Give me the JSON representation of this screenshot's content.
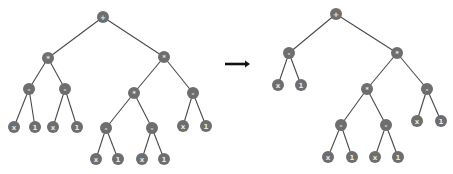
{
  "diagram": {
    "node_color": "#6e6e6e",
    "edge_color": "#4a4a4a",
    "node_radius": 6,
    "arrow": {
      "x1": 225,
      "y1": 64,
      "x2": 250,
      "y2": 64,
      "color": "#111111"
    },
    "trees": [
      {
        "name": "before",
        "nodes": [
          {
            "id": "a0",
            "label": "+",
            "x": 103,
            "y": 17
          },
          {
            "id": "a1",
            "label": "*",
            "x": 48,
            "y": 58
          },
          {
            "id": "a2",
            "label": "*",
            "x": 164,
            "y": 57
          },
          {
            "id": "a3",
            "label": "-",
            "x": 29,
            "y": 89
          },
          {
            "id": "a4",
            "label": "-",
            "x": 65,
            "y": 89
          },
          {
            "id": "a5",
            "label": "*",
            "x": 134,
            "y": 93
          },
          {
            "id": "a6",
            "label": "-",
            "x": 193,
            "y": 93
          },
          {
            "id": "a7",
            "label": "x",
            "x": 14,
            "y": 127
          },
          {
            "id": "a8",
            "label": "1",
            "x": 35,
            "y": 127
          },
          {
            "id": "a9",
            "label": "x",
            "x": 53,
            "y": 127
          },
          {
            "id": "a10",
            "label": "1",
            "x": 77,
            "y": 127
          },
          {
            "id": "a11",
            "label": "-",
            "x": 106,
            "y": 128
          },
          {
            "id": "a12",
            "label": "-",
            "x": 152,
            "y": 128
          },
          {
            "id": "a13",
            "label": "x",
            "x": 183,
            "y": 126
          },
          {
            "id": "a14",
            "label": "1",
            "x": 206,
            "y": 126
          },
          {
            "id": "a15",
            "label": "x",
            "x": 96,
            "y": 159
          },
          {
            "id": "a16",
            "label": "1",
            "x": 118,
            "y": 159
          },
          {
            "id": "a17",
            "label": "x",
            "x": 142,
            "y": 159
          },
          {
            "id": "a18",
            "label": "1",
            "x": 164,
            "y": 159
          }
        ],
        "edges": [
          [
            "a0",
            "a1"
          ],
          [
            "a0",
            "a2"
          ],
          [
            "a1",
            "a3"
          ],
          [
            "a1",
            "a4"
          ],
          [
            "a2",
            "a5"
          ],
          [
            "a2",
            "a6"
          ],
          [
            "a3",
            "a7"
          ],
          [
            "a3",
            "a8"
          ],
          [
            "a4",
            "a9"
          ],
          [
            "a4",
            "a10"
          ],
          [
            "a5",
            "a11"
          ],
          [
            "a5",
            "a12"
          ],
          [
            "a6",
            "a13"
          ],
          [
            "a6",
            "a14"
          ],
          [
            "a11",
            "a15"
          ],
          [
            "a11",
            "a16"
          ],
          [
            "a12",
            "a17"
          ],
          [
            "a12",
            "a18"
          ]
        ]
      },
      {
        "name": "after",
        "nodes": [
          {
            "id": "b0",
            "label": "+",
            "x": 336,
            "y": 14
          },
          {
            "id": "b1",
            "label": "-",
            "x": 289,
            "y": 53
          },
          {
            "id": "b2",
            "label": "*",
            "x": 397,
            "y": 53
          },
          {
            "id": "b3",
            "label": "x",
            "x": 278,
            "y": 85
          },
          {
            "id": "b4",
            "label": "1",
            "x": 301,
            "y": 85
          },
          {
            "id": "b5",
            "label": "*",
            "x": 367,
            "y": 89
          },
          {
            "id": "b6",
            "label": "-",
            "x": 427,
            "y": 89
          },
          {
            "id": "b7",
            "label": "-",
            "x": 341,
            "y": 125
          },
          {
            "id": "b8",
            "label": "-",
            "x": 386,
            "y": 125
          },
          {
            "id": "b9",
            "label": "x",
            "x": 417,
            "y": 121
          },
          {
            "id": "b10",
            "label": "1",
            "x": 441,
            "y": 121
          },
          {
            "id": "b11",
            "label": "x",
            "x": 328,
            "y": 157
          },
          {
            "id": "b12",
            "label": "1",
            "x": 352,
            "y": 157
          },
          {
            "id": "b13",
            "label": "x",
            "x": 375,
            "y": 157
          },
          {
            "id": "b14",
            "label": "1",
            "x": 398,
            "y": 157
          }
        ],
        "edges": [
          [
            "b0",
            "b1"
          ],
          [
            "b0",
            "b2"
          ],
          [
            "b1",
            "b3"
          ],
          [
            "b1",
            "b4"
          ],
          [
            "b2",
            "b5"
          ],
          [
            "b2",
            "b6"
          ],
          [
            "b5",
            "b7"
          ],
          [
            "b5",
            "b8"
          ],
          [
            "b6",
            "b9"
          ],
          [
            "b6",
            "b10"
          ],
          [
            "b7",
            "b11"
          ],
          [
            "b7",
            "b12"
          ],
          [
            "b8",
            "b13"
          ],
          [
            "b8",
            "b14"
          ]
        ]
      }
    ]
  }
}
